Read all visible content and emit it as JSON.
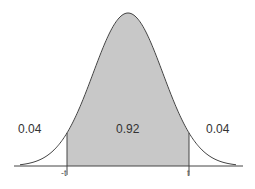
{
  "chart_data": {
    "type": "area",
    "title": "",
    "distribution": "normal",
    "mean": 0,
    "sd": 1,
    "shaded_interval": [
      "-t",
      "t"
    ],
    "tick_labels": [
      "-t",
      "t"
    ],
    "regions": [
      {
        "name": "left_tail",
        "label": "0.04",
        "value": 0.04,
        "shaded": false
      },
      {
        "name": "center",
        "label": "0.92",
        "value": 0.92,
        "shaded": true
      },
      {
        "name": "right_tail",
        "label": "0.04",
        "value": 0.04,
        "shaded": false
      }
    ],
    "xlabel": "",
    "ylabel": "",
    "grid": false,
    "colors": {
      "fill": "#c8c8c8",
      "line": "#444444",
      "axis": "#444444"
    }
  },
  "labels": {
    "left_tail": "0.04",
    "center": "0.92",
    "right_tail": "0.04",
    "tick_left": "-t",
    "tick_right": "t"
  }
}
